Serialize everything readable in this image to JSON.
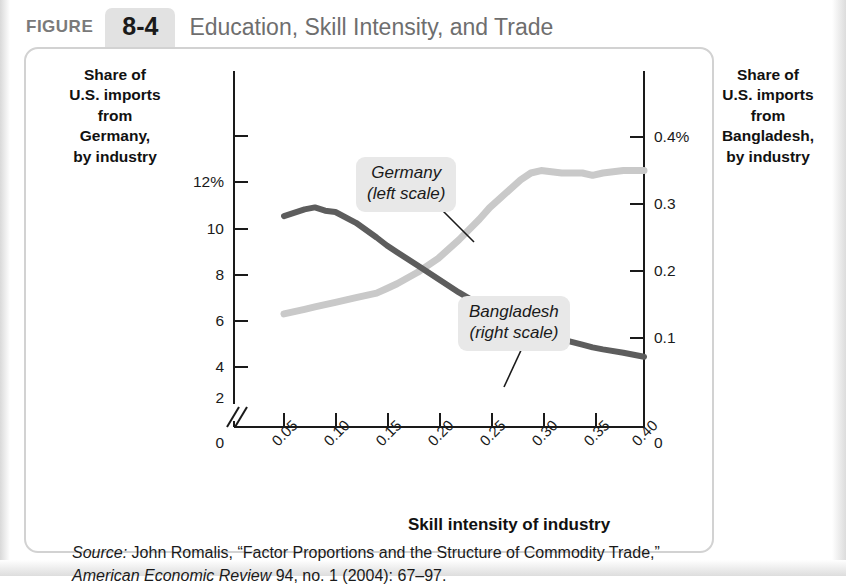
{
  "header": {
    "figure_word": "FIGURE",
    "figure_number": "8-4",
    "title": "Education, Skill Intensity, and Trade"
  },
  "axes": {
    "left_title": "Share of\nU.S. imports\nfrom\nGermany,\nby industry",
    "right_title": "Share of\nU.S. imports\nfrom\nBangladesh,\nby industry",
    "x_title": "Skill intensity of industry",
    "left_ticks": [
      "12%",
      "10",
      "8",
      "6",
      "4",
      "2",
      "0"
    ],
    "right_ticks": [
      "0.4%",
      "0.3",
      "0.2",
      "0.1",
      "0"
    ],
    "x_ticks": [
      "0.05",
      "0.10",
      "0.15",
      "0.20",
      "0.25",
      "0.30",
      "0.35",
      "0.40"
    ],
    "axis_break": "//"
  },
  "callouts": {
    "germany": "Germany\n(left scale)",
    "bangladesh": "Bangladesh\n(right scale)"
  },
  "source": {
    "lead": "Source:",
    "text_before_journal": " John Romalis, “Factor Proportions and the Structure of Commodity Trade,” ",
    "journal": "American Economic Review",
    "text_after_journal": " 94, no. 1 (2004): 67–97."
  },
  "colors": {
    "germany_line": "#c9c9c9",
    "bangladesh_line": "#5d5d5d",
    "axis": "#1a1a1a",
    "card_border": "#d2d2d2",
    "callout_bg": "#e8e8e8",
    "figure_tab_bg": "#e2e2e2",
    "title_gray": "#6e6e6e"
  },
  "chart_data": {
    "type": "line",
    "title": "Education, Skill Intensity, and Trade",
    "xlabel": "Skill intensity of industry",
    "ylabel": "Share of U.S. imports from Germany, by industry",
    "y2label": "Share of U.S. imports from Bangladesh, by industry",
    "xlim": [
      0.05,
      0.4
    ],
    "ylim": [
      0,
      12
    ],
    "y2lim": [
      0,
      0.4
    ],
    "grid": false,
    "legend": "inline-callouts",
    "x": [
      0.05,
      0.07,
      0.08,
      0.09,
      0.1,
      0.12,
      0.14,
      0.15,
      0.16,
      0.18,
      0.2,
      0.22,
      0.24,
      0.25,
      0.26,
      0.27,
      0.28,
      0.29,
      0.3,
      0.32,
      0.34,
      0.35,
      0.36,
      0.38,
      0.4
    ],
    "series": [
      {
        "name": "Germany (left scale)",
        "axis": "left",
        "units": "percent",
        "color": "#c9c9c9",
        "values": [
          4.3,
          4.5,
          4.6,
          4.7,
          4.8,
          5.0,
          5.2,
          5.4,
          5.6,
          6.1,
          6.7,
          7.5,
          8.4,
          8.9,
          9.3,
          9.7,
          10.1,
          10.4,
          10.5,
          10.4,
          10.4,
          10.3,
          10.4,
          10.5,
          10.5
        ]
      },
      {
        "name": "Bangladesh (right scale)",
        "axis": "right",
        "units": "percent",
        "color": "#5d5d5d",
        "values": [
          0.282,
          0.292,
          0.295,
          0.29,
          0.288,
          0.272,
          0.25,
          0.238,
          0.228,
          0.208,
          0.188,
          0.168,
          0.15,
          0.142,
          0.134,
          0.127,
          0.12,
          0.114,
          0.108,
          0.098,
          0.09,
          0.086,
          0.083,
          0.078,
          0.072
        ]
      }
    ]
  }
}
